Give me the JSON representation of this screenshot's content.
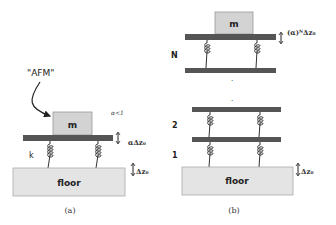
{
  "colors": {
    "background": "#ffffff",
    "mass_fill": "#d3d3d3",
    "plate_fill": "#555555",
    "floor_fill": "#e4e4e4",
    "outline": "#888888",
    "spring": "#333333",
    "text": "#222222"
  },
  "panel_a": {
    "caption": "(a)",
    "callout_label": "\"AFM\"",
    "mass_label": "m",
    "spring_label": "k",
    "condition_label": "α<1",
    "plate_displacement_label": "αΔz₀",
    "floor_label": "floor",
    "floor_displacement_label": "Δz₀"
  },
  "panel_b": {
    "caption": "(b)",
    "mass_label": "m",
    "top_displacement_label": "(α)ᴺΔz₀",
    "floor_label": "floor",
    "floor_displacement_label": "Δz₀",
    "stage_labels": [
      "N",
      "2",
      "1"
    ],
    "ellipsis": [
      ".",
      "."
    ]
  }
}
